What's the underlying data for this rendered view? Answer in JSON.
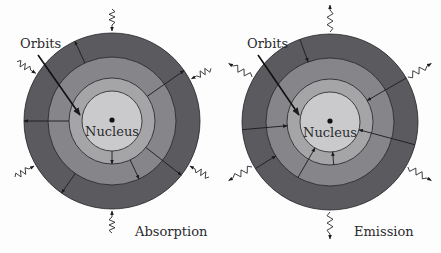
{
  "colors": {
    "background": "#fdfdfd",
    "ring_outer": "#5b5b5f",
    "ring_second": "#86868a",
    "ring_third": "#a5a5a8",
    "nucleus_area": "#cacacc",
    "line": "#1e1e22",
    "text": "#2a2a2e"
  },
  "ring_radii": [
    88,
    64,
    43,
    30
  ],
  "diagrams": [
    {
      "id": "absorption",
      "caption": "Absorption",
      "orbits_label": "Orbits",
      "nucleus_label": "Nucleus",
      "center": [
        112,
        121
      ],
      "caption_pos": [
        135,
        236
      ],
      "orbits_label_pos": [
        20,
        48
      ],
      "orbits_pointer": [
        [
          38,
          55
        ],
        [
          80,
          115
        ]
      ],
      "photon_direction": "in",
      "transitions": [
        {
          "from_r": 64,
          "to_r": 88,
          "angle_deg": -115
        },
        {
          "from_r": 43,
          "to_r": 88,
          "angle_deg": -35
        },
        {
          "from_r": 43,
          "to_r": 88,
          "angle_deg": 180
        },
        {
          "from_r": 30,
          "to_r": 43,
          "angle_deg": 90
        },
        {
          "from_r": 43,
          "to_r": 64,
          "angle_deg": 65
        },
        {
          "from_r": 43,
          "to_r": 88,
          "angle_deg": 38
        },
        {
          "from_r": 64,
          "to_r": 88,
          "angle_deg": 125
        }
      ],
      "photons": [
        {
          "angle_deg": -90
        },
        {
          "angle_deg": -148
        },
        {
          "angle_deg": -28
        },
        {
          "angle_deg": 150
        },
        {
          "angle_deg": 30
        },
        {
          "angle_deg": 90
        }
      ]
    },
    {
      "id": "emission",
      "caption": "Emission",
      "orbits_label": "Orbits",
      "nucleus_label": "Nucleus",
      "center": [
        330,
        122
      ],
      "caption_pos": [
        354,
        236
      ],
      "orbits_label_pos": [
        247,
        48
      ],
      "orbits_pointer": [
        [
          258,
          55
        ],
        [
          299,
          115
        ]
      ],
      "photon_direction": "out",
      "transitions": [
        {
          "from_r": 88,
          "to_r": 64,
          "angle_deg": -110
        },
        {
          "from_r": 88,
          "to_r": 43,
          "angle_deg": -30
        },
        {
          "from_r": 88,
          "to_r": 43,
          "angle_deg": 175
        },
        {
          "from_r": 88,
          "to_r": 64,
          "angle_deg": 148
        },
        {
          "from_r": 64,
          "to_r": 30,
          "angle_deg": 120
        },
        {
          "from_r": 43,
          "to_r": 30,
          "angle_deg": 85
        },
        {
          "from_r": 88,
          "to_r": 30,
          "angle_deg": 15
        }
      ],
      "photons": [
        {
          "angle_deg": -90
        },
        {
          "angle_deg": -150
        },
        {
          "angle_deg": -30
        },
        {
          "angle_deg": 150
        },
        {
          "angle_deg": 30
        },
        {
          "angle_deg": 90
        }
      ]
    }
  ]
}
